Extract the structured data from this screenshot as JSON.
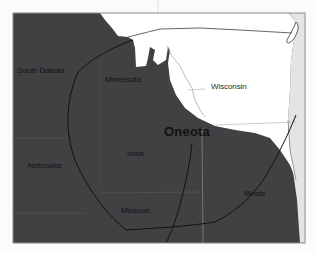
{
  "map": {
    "title": "Oneota",
    "colors": {
      "background": "#fbfbfb",
      "culture_region": "#414043",
      "non_region_land": "#ffffff",
      "lake_michigan": "#e4e4e4",
      "frame": "#8a8a8a",
      "boundary_line": "#111111",
      "state_border": "#9a9a9a"
    },
    "labels": {
      "south_dakota": "South Dakota",
      "minnesota": "Minnesota",
      "wisconsin": "Wisconsin",
      "oneota": "Oneota",
      "nebraska": "Nebraska",
      "iowa": "Iowa",
      "missouri": "Missouri",
      "illinois": "Illinois"
    }
  }
}
